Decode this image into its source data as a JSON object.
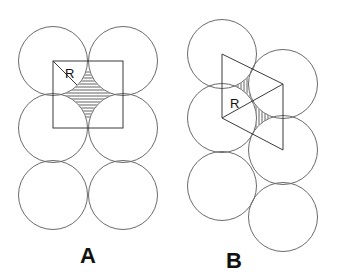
{
  "figure_a": {
    "label": "A",
    "radius_label": "R",
    "packing": "square",
    "circle_radius": 34,
    "circle_centers": [
      [
        53,
        61
      ],
      [
        123,
        61
      ],
      [
        53,
        128
      ],
      [
        123,
        128
      ],
      [
        53,
        195
      ],
      [
        123,
        195
      ]
    ],
    "cell": {
      "shape": "square",
      "corners": [
        [
          53,
          61
        ],
        [
          123,
          61
        ],
        [
          123,
          128
        ],
        [
          53,
          128
        ]
      ]
    }
  },
  "figure_b": {
    "label": "B",
    "radius_label": "R",
    "packing": "hexagonal",
    "circle_radius": 34,
    "circle_centers": [
      [
        222,
        54
      ],
      [
        283,
        84
      ],
      [
        222,
        118
      ],
      [
        283,
        150
      ],
      [
        222,
        186
      ],
      [
        283,
        217
      ]
    ],
    "cell": {
      "shape": "two triangles",
      "vertices": [
        [
          222,
          54
        ],
        [
          283,
          84
        ],
        [
          222,
          118
        ],
        [
          283,
          150
        ]
      ]
    }
  },
  "colors": {
    "stroke": "#3a3a3a",
    "circle": "#6a6a6a",
    "background": "#ffffff"
  }
}
